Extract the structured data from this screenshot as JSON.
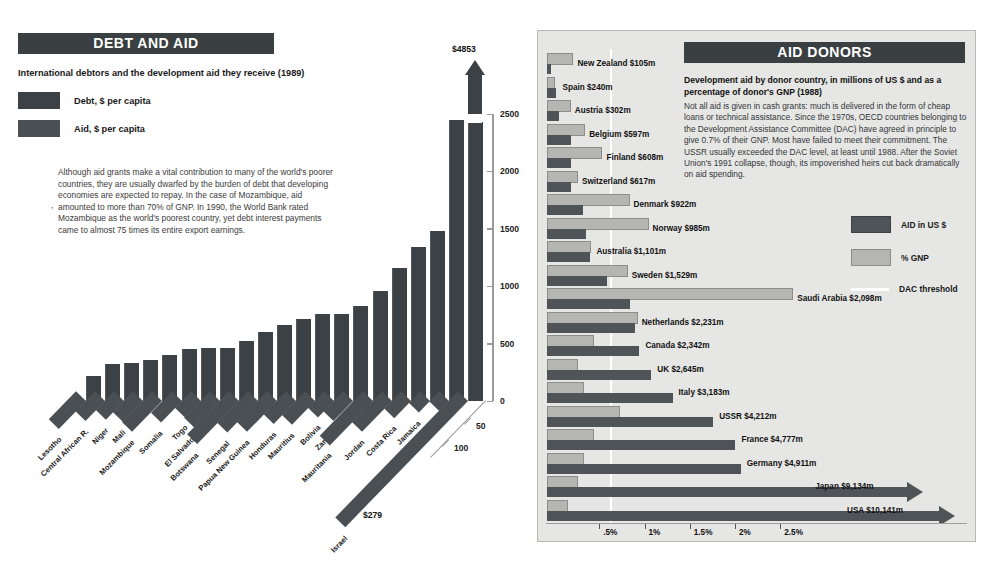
{
  "debt_panel": {
    "header": "DEBT AND AID",
    "subtitle": "International debtors and the development aid they receive (1989)",
    "legend": [
      {
        "label": "Debt, $ per capita",
        "color": "#3c4145"
      },
      {
        "label": "Aid, $ per capita",
        "color": "#4a4f53"
      }
    ],
    "body": "Although aid grants make a vital contribution to many of the world's poorer countries, they are usually dwarfed by the burden of debt that developing economies are expected to repay. In the case of Mozambique, aid amounted to more than 70% of GNP.  In 1990, the World Bank rated Mozambique as the world's poorest country, yet debt interest payments came to almost 75 times its entire export earnings.",
    "top_value_label": "$4853",
    "israel_value_label": "$279",
    "tick_dash": ","
  },
  "aid_panel": {
    "header": "AID DONORS",
    "subtitle": "Development aid by donor country, in millions of US $ and as a percentage of donor's GNP (1988)",
    "body": "Not all aid is given in cash grants: much is delivered in the form of cheap loans or technical assistance. Since the 1970s, OECD countries belonging to the Development Assistance Committee (DAC) have agreed in principle to give 0.7% of their GNP. Most have failed to meet their commitment. The USSR usually exceeded the DAC level, at least until 1988.  After the Soviet Union's 1991 collapse, though, its impoverished heirs cut back dramatically on aid spending.",
    "legend": [
      {
        "label": "AID in US $",
        "type": "swatch",
        "color": "#4f5459"
      },
      {
        "label": "% GNP",
        "type": "swatch",
        "color": "#b5b5b2"
      },
      {
        "label": "DAC threshold",
        "type": "line",
        "color": "#ffffff"
      }
    ]
  },
  "chart_data": [
    {
      "type": "bar",
      "title": "DEBT AND AID",
      "subtitle": "International debtors and the development aid they receive (1989)",
      "xlabel": "",
      "ylabel": "Debt, $ per capita",
      "zlabel": "Aid, $ per capita",
      "ylim": [
        0,
        2500
      ],
      "yticks": [
        0,
        500,
        1000,
        1500,
        2000,
        2500
      ],
      "zticks": [
        50,
        100
      ],
      "grid": false,
      "legend_position": "top-left",
      "categories": [
        "Lesotho",
        "Central African R.",
        "Niger",
        "Mali",
        "Mozambique",
        "Somalia",
        "Togo",
        "El Salvador",
        "Botswana",
        "Senegal",
        "Papua New Guinea",
        "Honduras",
        "Mauritius",
        "Bolivia",
        "Zambia",
        "Mauritania",
        "Jordan",
        "Costa Rica",
        "Jamaica",
        "Gabon",
        "Israel"
      ],
      "series": [
        {
          "name": "Debt, $ per capita",
          "values": [
            215,
            320,
            330,
            360,
            400,
            455,
            460,
            465,
            520,
            600,
            660,
            710,
            760,
            760,
            830,
            960,
            1160,
            1340,
            1480,
            2450,
            4853
          ]
        },
        {
          "name": "Aid, $ per capita",
          "values": [
            62,
            44,
            42,
            46,
            68,
            48,
            36,
            58,
            96,
            70,
            68,
            50,
            52,
            36,
            44,
            98,
            68,
            38,
            26,
            22,
            279
          ]
        }
      ],
      "annotations": [
        {
          "text": "$4853",
          "target": "Israel debt (bar broken, exceeds axis)"
        },
        {
          "text": "$279",
          "target": "Israel aid"
        }
      ]
    },
    {
      "type": "bar",
      "orientation": "horizontal",
      "title": "AID DONORS",
      "subtitle": "Development aid by donor country, in millions of US $ and as a percentage of donor's GNP (1988)",
      "xlabel": "",
      "ylabel": "",
      "xticks_percent": [
        0.5,
        1,
        1.5,
        2,
        2.5
      ],
      "xtick_labels": [
        ".5%",
        "1%",
        "1.5%",
        "2%",
        "2.5%"
      ],
      "dac_threshold_percent": 0.7,
      "grid": false,
      "legend_position": "right",
      "categories": [
        "New Zealand",
        "Spain",
        "Austria",
        "Belgium",
        "Finland",
        "Switzerland",
        "Denmark",
        "Norway",
        "Australia",
        "Sweden",
        "Saudi Arabia",
        "Netherlands",
        "Canada",
        "UK",
        "Italy",
        "USSR",
        "France",
        "Germany",
        "Japan",
        "USA"
      ],
      "labels": [
        "New Zealand $105m",
        "Spain $240m",
        "Austria $302m",
        "Belgium $597m",
        "Finland $608m",
        "Switzerland $617m",
        "Denmark $922m",
        "Norway $985m",
        "Australia $1,101m",
        "Sweden $1,529m",
        "Saudi Arabia $2,098m",
        "Netherlands $2,231m",
        "Canada $2,342m",
        "UK $2,645m",
        "Italy $3,183m",
        "USSR $4,212m",
        "France $4,777m",
        "Germany $4,911m",
        "Japan $9,134m",
        "USA $10,141m"
      ],
      "series": [
        {
          "name": "AID in US $",
          "unit": "millions US$",
          "values": [
            105,
            240,
            302,
            597,
            608,
            617,
            922,
            985,
            1101,
            1529,
            2098,
            2231,
            2342,
            2645,
            3183,
            4212,
            4777,
            4911,
            9134,
            10141
          ]
        },
        {
          "name": "% GNP",
          "unit": "percent of GNP",
          "values": [
            0.27,
            0.07,
            0.24,
            0.4,
            0.59,
            0.32,
            0.89,
            1.1,
            0.46,
            0.87,
            2.7,
            0.98,
            0.5,
            0.32,
            0.39,
            0.79,
            0.5,
            0.39,
            0.32,
            0.21
          ]
        }
      ],
      "truncated_bars": [
        "Japan",
        "USA"
      ]
    }
  ]
}
